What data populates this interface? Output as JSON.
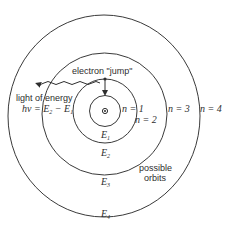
{
  "diagram": {
    "electron_jump_label": "electron \"jump\"",
    "light_label": "light of energy",
    "energy_formula": {
      "lhs": "hν = E",
      "sub2": "2",
      "minus": " − E",
      "sub1": "1"
    },
    "orbit_labels": [
      {
        "n": "n = 1",
        "energy": "E",
        "energy_sub": "1"
      },
      {
        "n": "n = 2",
        "energy": "E",
        "energy_sub": "2"
      },
      {
        "n": "n = 3",
        "energy": "E",
        "energy_sub": "3"
      },
      {
        "n": "n = 4",
        "energy": "E",
        "energy_sub": "4"
      }
    ],
    "possible_orbits_label": [
      "possible",
      "orbits"
    ],
    "colors": {
      "line": "#3a3a3a",
      "text": "#2e2e2e",
      "background": "#ffffff"
    }
  }
}
